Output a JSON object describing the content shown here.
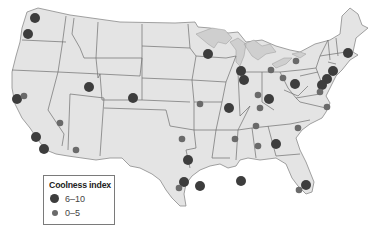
{
  "map": {
    "subject": "United States — Coolness index by city",
    "colors": {
      "background": "#ffffff",
      "land": "#e4e4e4",
      "great_lakes": "#cfcfcf",
      "borders": "#6e6e6e",
      "dot_high": "#3d3d3d",
      "dot_low": "#6a6a6a"
    },
    "dots": [
      {
        "x": 35,
        "y": 18,
        "size": "large"
      },
      {
        "x": 28,
        "y": 34,
        "size": "large"
      },
      {
        "x": 17,
        "y": 99,
        "size": "large"
      },
      {
        "x": 24,
        "y": 96,
        "size": "small"
      },
      {
        "x": 89,
        "y": 87,
        "size": "large"
      },
      {
        "x": 133,
        "y": 98,
        "size": "large"
      },
      {
        "x": 60,
        "y": 123,
        "size": "small"
      },
      {
        "x": 36,
        "y": 137,
        "size": "large"
      },
      {
        "x": 44,
        "y": 149,
        "size": "large"
      },
      {
        "x": 76,
        "y": 150,
        "size": "small"
      },
      {
        "x": 208,
        "y": 54,
        "size": "large"
      },
      {
        "x": 241,
        "y": 71,
        "size": "large"
      },
      {
        "x": 244,
        "y": 80,
        "size": "large"
      },
      {
        "x": 271,
        "y": 70,
        "size": "small"
      },
      {
        "x": 283,
        "y": 78,
        "size": "small"
      },
      {
        "x": 296,
        "y": 61,
        "size": "small"
      },
      {
        "x": 295,
        "y": 84,
        "size": "large"
      },
      {
        "x": 348,
        "y": 53,
        "size": "large"
      },
      {
        "x": 333,
        "y": 71,
        "size": "large"
      },
      {
        "x": 327,
        "y": 79,
        "size": "large"
      },
      {
        "x": 322,
        "y": 85,
        "size": "large"
      },
      {
        "x": 320,
        "y": 92,
        "size": "small"
      },
      {
        "x": 258,
        "y": 95,
        "size": "small"
      },
      {
        "x": 269,
        "y": 99,
        "size": "large"
      },
      {
        "x": 260,
        "y": 108,
        "size": "small"
      },
      {
        "x": 200,
        "y": 104,
        "size": "small"
      },
      {
        "x": 229,
        "y": 108,
        "size": "large"
      },
      {
        "x": 327,
        "y": 107,
        "size": "small"
      },
      {
        "x": 256,
        "y": 126,
        "size": "small"
      },
      {
        "x": 298,
        "y": 128,
        "size": "small"
      },
      {
        "x": 182,
        "y": 139,
        "size": "small"
      },
      {
        "x": 235,
        "y": 139,
        "size": "small"
      },
      {
        "x": 258,
        "y": 146,
        "size": "small"
      },
      {
        "x": 276,
        "y": 144,
        "size": "large"
      },
      {
        "x": 188,
        "y": 160,
        "size": "large"
      },
      {
        "x": 184,
        "y": 182,
        "size": "large"
      },
      {
        "x": 179,
        "y": 188,
        "size": "small"
      },
      {
        "x": 200,
        "y": 186,
        "size": "large"
      },
      {
        "x": 241,
        "y": 181,
        "size": "large"
      },
      {
        "x": 306,
        "y": 185,
        "size": "large"
      },
      {
        "x": 299,
        "y": 190,
        "size": "small"
      }
    ]
  },
  "legend": {
    "title": "Coolness index",
    "items": [
      {
        "label": "6–10",
        "size": "large"
      },
      {
        "label": "0–5",
        "size": "small"
      }
    ]
  }
}
